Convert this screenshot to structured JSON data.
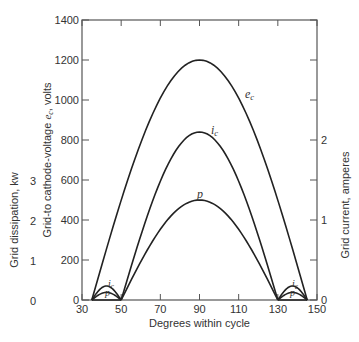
{
  "chart_data": {
    "type": "line",
    "title": "",
    "xlabel": "Degrees within cycle",
    "ylabel_left_outer": "Grid dissipation, kw",
    "ylabel_left_inner": "Grid-to cathode-voltage e_c, volts",
    "ylabel_right": "Grid current, amperes",
    "xlim": [
      30,
      150
    ],
    "ylim": [
      0,
      1400
    ],
    "x_ticks": [
      "30",
      "50",
      "70",
      "90",
      "110",
      "130",
      "150"
    ],
    "y_ticks_left": [
      "0",
      "200",
      "400",
      "600",
      "800",
      "1000",
      "1200",
      "1400"
    ],
    "y_ticks_dissipation": [
      "0",
      "1",
      "2",
      "3"
    ],
    "y_ticks_current": [
      "0",
      "1",
      "2"
    ],
    "grid": false,
    "series": [
      {
        "name": "e_c",
        "label": "e_c",
        "x": [
          35,
          50,
          70,
          90,
          110,
          130,
          145
        ],
        "values": [
          0,
          310,
          950,
          1200,
          950,
          310,
          0
        ],
        "peak": {
          "x": 90,
          "y": 1200
        }
      },
      {
        "name": "i_c",
        "label": "i_c",
        "x": [
          50,
          70,
          90,
          110,
          130
        ],
        "values": [
          0,
          580,
          840,
          580,
          0
        ],
        "peak": {
          "x": 90,
          "y": 840
        },
        "peak_amperes": 2.1
      },
      {
        "name": "p",
        "label": "p",
        "x": [
          50,
          70,
          90,
          110,
          130
        ],
        "values": [
          0,
          330,
          500,
          330,
          0
        ],
        "peak": {
          "x": 90,
          "y": 500
        },
        "peak_kw": 2.5
      },
      {
        "name": "i_c_small_left",
        "label": "i_c",
        "x": [
          35,
          42,
          50
        ],
        "values": [
          0,
          70,
          0
        ]
      },
      {
        "name": "p_small_left",
        "label": "p",
        "x": [
          35,
          42,
          50
        ],
        "values": [
          0,
          38,
          0
        ]
      },
      {
        "name": "i_c_small_right",
        "label": "i_c",
        "x": [
          130,
          138,
          145
        ],
        "values": [
          0,
          70,
          0
        ]
      },
      {
        "name": "p_small_right",
        "label": "p",
        "x": [
          130,
          138,
          145
        ],
        "values": [
          0,
          38,
          0
        ]
      }
    ]
  }
}
